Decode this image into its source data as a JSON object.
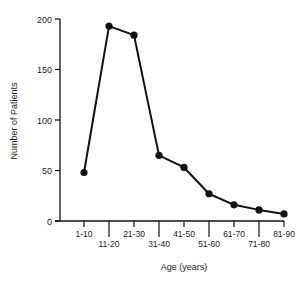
{
  "chart_data": {
    "type": "line",
    "title": "",
    "xlabel": "Age (years)",
    "ylabel": "Number of Patients",
    "categories": [
      "1-10",
      "11-20",
      "21-30",
      "31-40",
      "41-50",
      "51-60",
      "61-70",
      "71-80",
      "81-90"
    ],
    "series": [
      {
        "name": "Patients",
        "values": [
          48,
          193,
          184,
          65,
          53,
          27,
          16,
          11,
          7
        ]
      }
    ],
    "ylim": [
      0,
      200
    ],
    "yticks": [
      0,
      50,
      100,
      150,
      200
    ],
    "grid": false,
    "legend": null,
    "markers": "filled-circle",
    "color": "#111111"
  }
}
